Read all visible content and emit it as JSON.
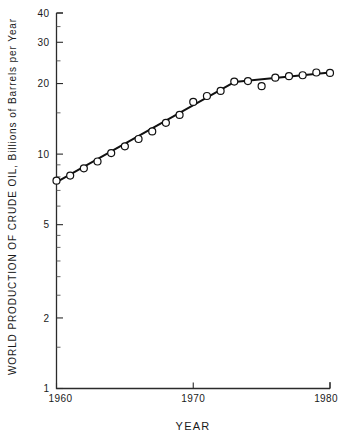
{
  "chart_data": {
    "type": "line",
    "title": "",
    "xlabel": "YEAR",
    "ylabel": "WORLD PRODUCTION OF CRUDE OIL, Billions of Barrels per Year",
    "yscale": "log",
    "ylim": [
      1,
      40
    ],
    "xlim": [
      1960,
      1980
    ],
    "grid": false,
    "legend": "none",
    "ytick_labels": [
      "1",
      "2",
      "5",
      "10",
      "20",
      "30",
      "40"
    ],
    "ytick_values": [
      1,
      2,
      5,
      10,
      20,
      30,
      40
    ],
    "xtick_labels": [
      "1960",
      "1970",
      "1980"
    ],
    "xtick_values": [
      1960,
      1970,
      1980
    ],
    "x": [
      1960,
      1961,
      1962,
      1963,
      1964,
      1965,
      1966,
      1967,
      1968,
      1969,
      1970,
      1971,
      1972,
      1973,
      1974,
      1975,
      1976,
      1977,
      1978,
      1979,
      1980
    ],
    "values": [
      7.7,
      8.1,
      8.7,
      9.3,
      10.1,
      10.8,
      11.6,
      12.5,
      13.6,
      14.7,
      16.7,
      17.7,
      18.6,
      20.4,
      20.5,
      19.5,
      21.2,
      21.5,
      21.7,
      22.3,
      22.2
    ],
    "marker": "open-circle",
    "series": [
      {
        "name": "World crude oil production",
        "values": [
          7.7,
          8.1,
          8.7,
          9.3,
          10.1,
          10.8,
          11.6,
          12.5,
          13.6,
          14.7,
          16.7,
          17.7,
          18.6,
          20.4,
          20.5,
          19.5,
          21.2,
          21.5,
          21.7,
          22.3,
          22.2
        ]
      }
    ],
    "outlier_points": [
      {
        "x": 1975,
        "y": 19.5,
        "note": "point below trend line"
      }
    ],
    "trend_segments": [
      {
        "name": "growth-segment",
        "x_start": 1960,
        "y_start": 7.6,
        "x_end": 1973,
        "y_end": 20.3
      },
      {
        "name": "plateau-segment",
        "x_start": 1973,
        "y_start": 20.3,
        "x_end": 1980,
        "y_end": 22.3
      }
    ]
  },
  "axes": {
    "y_title": "WORLD PRODUCTION OF CRUDE OIL, Billions of Barrels per Year",
    "x_title": "YEAR"
  }
}
